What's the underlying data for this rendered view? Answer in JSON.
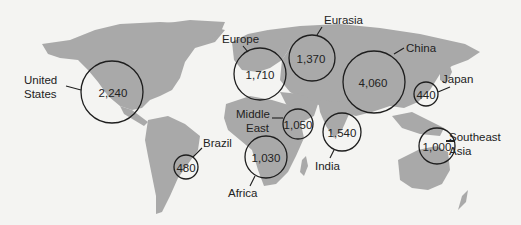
{
  "map": {
    "land_color": "#a9a9a9",
    "background_color": "#f4f4f2",
    "bubble_stroke": "#1e1e1e"
  },
  "regions": [
    {
      "name": "United States",
      "label_lines": [
        "United",
        "States"
      ],
      "value": "2,240"
    },
    {
      "name": "Europe",
      "label_lines": [
        "Europe"
      ],
      "value": "1,710"
    },
    {
      "name": "Eurasia",
      "label_lines": [
        "Eurasia"
      ],
      "value": "1,370"
    },
    {
      "name": "China",
      "label_lines": [
        "China"
      ],
      "value": "4,060"
    },
    {
      "name": "Japan",
      "label_lines": [
        "Japan"
      ],
      "value": "440"
    },
    {
      "name": "Middle East",
      "label_lines": [
        "Middle",
        "East"
      ],
      "value": "1,050"
    },
    {
      "name": "India",
      "label_lines": [
        "India"
      ],
      "value": "1,540"
    },
    {
      "name": "Southeast Asia",
      "label_lines": [
        "Southeast",
        "Asia"
      ],
      "value": "1,000"
    },
    {
      "name": "Brazil",
      "label_lines": [
        "Brazil"
      ],
      "value": "480"
    },
    {
      "name": "Africa",
      "label_lines": [
        "Africa"
      ],
      "value": "1,030"
    }
  ]
}
